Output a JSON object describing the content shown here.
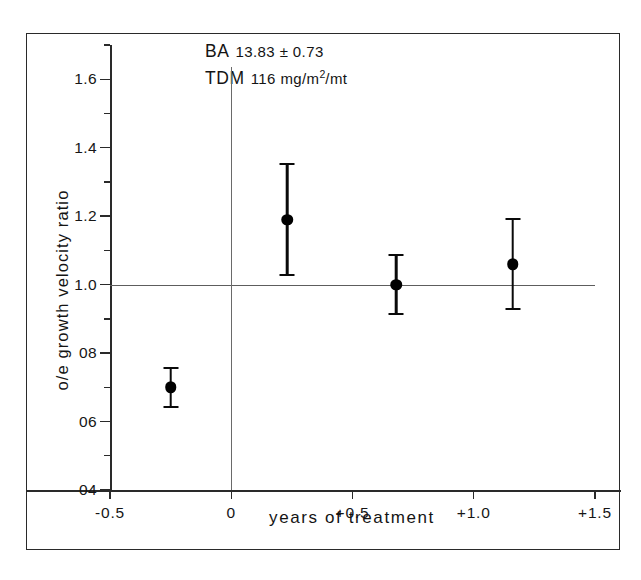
{
  "chart_data": {
    "type": "scatter",
    "title": "",
    "xlabel": "years  of  treatment",
    "ylabel": "o/e  growth  velocity  ratio",
    "xlim": [
      -0.5,
      1.5
    ],
    "ylim": [
      0.4,
      1.7
    ],
    "grid": false,
    "legend": null,
    "reference_lines": [
      {
        "orientation": "horizontal",
        "value": 1.0
      },
      {
        "orientation": "vertical",
        "value": 0.0
      }
    ],
    "xticks": [
      {
        "value": -0.5,
        "label": "-0.5"
      },
      {
        "value": 0.0,
        "label": "0"
      },
      {
        "value": 0.5,
        "label": "+0.5"
      },
      {
        "value": 1.0,
        "label": "+1.0"
      },
      {
        "value": 1.5,
        "label": "+1.5"
      }
    ],
    "yticks": [
      {
        "value": 1.6,
        "label": "1.6"
      },
      {
        "value": 1.4,
        "label": "1.4"
      },
      {
        "value": 1.2,
        "label": "1.2"
      },
      {
        "value": 1.0,
        "label": "1.0"
      },
      {
        "value": 0.8,
        "label": "08"
      },
      {
        "value": 0.6,
        "label": "06"
      },
      {
        "value": 0.4,
        "label": "04"
      }
    ],
    "yticks_minor": [
      1.7,
      1.5,
      1.3,
      1.1,
      0.9,
      0.7,
      0.5
    ],
    "points": [
      {
        "x": -0.25,
        "y": 0.7,
        "yerr": 0.06
      },
      {
        "x": 0.23,
        "y": 1.19,
        "yerr": 0.165
      },
      {
        "x": 0.68,
        "y": 1.0,
        "yerr": 0.09
      },
      {
        "x": 1.16,
        "y": 1.06,
        "yerr": 0.135
      }
    ],
    "annotations": [
      {
        "key": "BA",
        "value": "13.83 ± 0.73"
      },
      {
        "key": "TDM",
        "value": "116 mg/m",
        "sup": "2",
        "value_tail": "/mt"
      }
    ]
  },
  "colors": {
    "marker": "#000000",
    "axis": "#2a2a2a",
    "reference": "#5d5d5d",
    "background": "#ffffff"
  }
}
